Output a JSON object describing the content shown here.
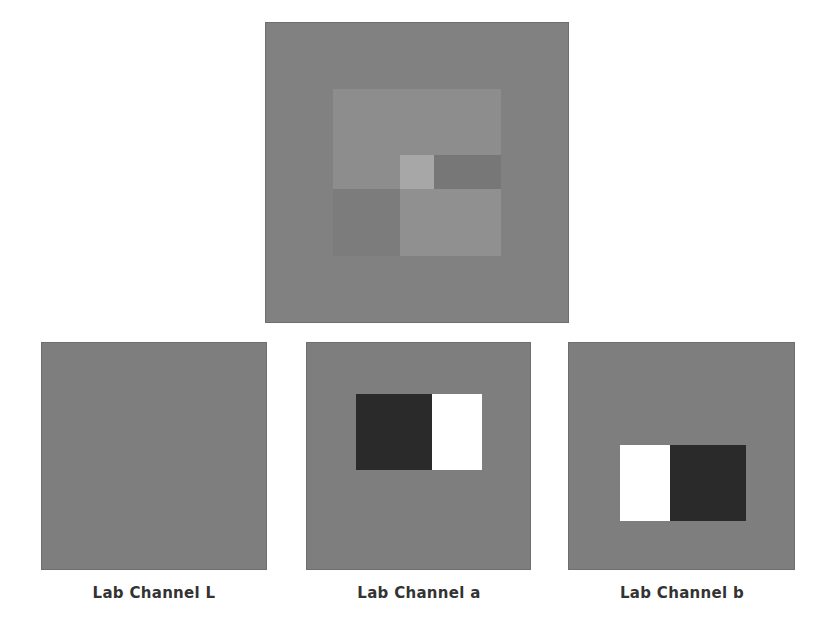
{
  "figure": {
    "composite": {
      "name": "composite-image",
      "background": "#818181",
      "regions": [
        {
          "name": "upper-rect",
          "color": "#8d8d8d"
        },
        {
          "name": "light-square",
          "color": "#a7a7a7"
        },
        {
          "name": "dark-strip",
          "color": "#777777"
        },
        {
          "name": "lower-rect",
          "color": "#909090"
        }
      ]
    },
    "panels": [
      {
        "label": "Lab Channel L",
        "background": "#7e7e7e"
      },
      {
        "label": "Lab Channel a",
        "background": "#7e7e7e",
        "dark": "#2a2a2a",
        "light": "#ffffff"
      },
      {
        "label": "Lab Channel b",
        "background": "#7e7e7e",
        "dark": "#2a2a2a",
        "light": "#ffffff"
      }
    ]
  }
}
